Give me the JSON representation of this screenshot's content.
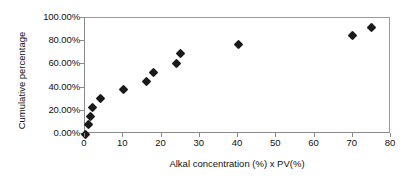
{
  "chart_data": {
    "type": "scatter",
    "title": "",
    "xlabel": "Alkal concentration (%) x PV(%)",
    "ylabel": "Cumulative percentage",
    "xlim": [
      0,
      80
    ],
    "ylim": [
      0,
      1.0
    ],
    "grid": false,
    "legend": null,
    "marker": "filled-diamond",
    "marker_color": "#1a1a1a",
    "xticks": [
      0,
      10,
      20,
      30,
      40,
      50,
      60,
      70,
      80
    ],
    "xtick_labels": [
      "0",
      "10",
      "20",
      "30",
      "40",
      "50",
      "60",
      "70",
      "80"
    ],
    "yticks": [
      0,
      0.2,
      0.4,
      0.6,
      0.8,
      1.0
    ],
    "ytick_labels": [
      "0.00%",
      "20.00%",
      "40.00%",
      "60.00%",
      "80.00%",
      "100.00%"
    ],
    "x": [
      0,
      1,
      1.5,
      2,
      4,
      10,
      16,
      18,
      24,
      25,
      40,
      70,
      75
    ],
    "y": [
      0.0,
      0.08,
      0.155,
      0.23,
      0.31,
      0.385,
      0.455,
      0.53,
      0.61,
      0.69,
      0.77,
      0.845,
      0.92
    ],
    "points": [
      {
        "x": 0,
        "y": 0.0
      },
      {
        "x": 1,
        "y": 0.08
      },
      {
        "x": 1.5,
        "y": 0.155
      },
      {
        "x": 2,
        "y": 0.23
      },
      {
        "x": 4,
        "y": 0.31
      },
      {
        "x": 10,
        "y": 0.385
      },
      {
        "x": 16,
        "y": 0.455
      },
      {
        "x": 18,
        "y": 0.53
      },
      {
        "x": 24,
        "y": 0.61
      },
      {
        "x": 25,
        "y": 0.69
      },
      {
        "x": 40,
        "y": 0.77
      },
      {
        "x": 70,
        "y": 0.845
      },
      {
        "x": 75,
        "y": 0.92
      }
    ]
  },
  "colors": {
    "marker": "#1a1a1a",
    "axis": "#8a8a8a",
    "text": "#111111",
    "background": "#ffffff"
  }
}
